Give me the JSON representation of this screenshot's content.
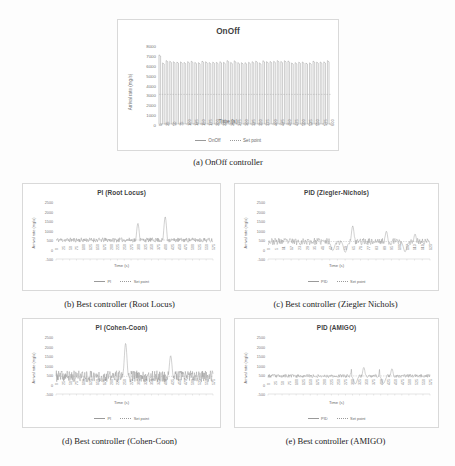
{
  "figure": {
    "caption_a": "(a) OnOff controller",
    "caption_b": "(b) Best controller (Root Locus)",
    "caption_c": "(c) Best controller (Ziegler Nichols)",
    "caption_d": "(d) Best controller (Cohen-Coon)",
    "caption_e": "(e) Best controller (AMIGO)"
  },
  "common": {
    "ylabel": "Arrival rate (mg/s)",
    "xlabel": "Time (s)",
    "setpoint_legend": "Set point",
    "line_color": "#8c8c8c",
    "setpoint_color": "#a6a6a6",
    "grid": false
  },
  "chart_data": [
    {
      "id": "a",
      "type": "line",
      "title": "OnOff",
      "xlabel": "Time (s)",
      "ylabel": "Arrival rate (mg/s)",
      "ylim": [
        0,
        8000
      ],
      "yticks": [
        8000,
        7000,
        6000,
        5000,
        4000,
        3000,
        2000,
        1000,
        0
      ],
      "xlim": [
        0,
        600
      ],
      "xticks": [
        0,
        25,
        50,
        75,
        100,
        125,
        150,
        175,
        200,
        225,
        250,
        275,
        300,
        325,
        350,
        375,
        400,
        425,
        450,
        475,
        500,
        525,
        550,
        575,
        600
      ],
      "legend": [
        "OnOff",
        "Set point"
      ],
      "legend_position": "bottom",
      "series": [
        {
          "name": "OnOff",
          "description": "Fast square-wave oscillation between ~0 and ~6300 mg/s, initial overshoot spike to ~7000 mg/s, ~48 full cycles over 600 s",
          "oscillation_low": 0,
          "oscillation_high": 6300,
          "first_peak": 7000,
          "cycles": 48
        },
        {
          "name": "Set point",
          "description": "Constant dashed reference line",
          "value": 3000
        }
      ]
    },
    {
      "id": "b",
      "type": "line",
      "title": "PI (Root Locus)",
      "xlabel": "Time (s)",
      "ylabel": "Arrival rate (mg/s)",
      "ylim": [
        -500,
        2500
      ],
      "yticks": [
        2500,
        2000,
        1500,
        1000,
        500,
        0,
        -500
      ],
      "xlim": [
        0,
        575
      ],
      "xticks": [
        0,
        25,
        50,
        75,
        100,
        125,
        150,
        175,
        200,
        225,
        250,
        275,
        300,
        325,
        350,
        375,
        400,
        425,
        450,
        475,
        500,
        525,
        550,
        575
      ],
      "legend": [
        "PI",
        "Set point"
      ],
      "legend_position": "bottom",
      "series": [
        {
          "name": "PI",
          "description": "Low-amplitude noise band around the set point with two large transient spikes",
          "baseline": 500,
          "noise_amplitude": 120,
          "spikes": [
            {
              "time": 300,
              "peak": 1300,
              "undershoot": 150
            },
            {
              "time": 400,
              "peak": 1650,
              "undershoot": 120
            }
          ]
        },
        {
          "name": "Set point",
          "value": 500
        }
      ]
    },
    {
      "id": "c",
      "type": "line",
      "title": "PID (Ziegler-Nichols)",
      "xlabel": "Time (s)",
      "ylabel": "Arrival rate (mg/s)",
      "ylim": [
        -500,
        2500
      ],
      "yticks": [
        2500,
        2000,
        1500,
        1000,
        500,
        0,
        -500
      ],
      "xlim": [
        0,
        130
      ],
      "xticks": [
        0,
        5,
        11,
        17,
        23,
        29,
        35,
        41,
        47,
        53,
        59,
        65,
        71,
        77,
        83,
        89,
        95,
        101,
        107,
        113,
        119,
        125
      ],
      "legend": [
        "PID",
        "Set point"
      ],
      "legend_position": "bottom",
      "series": [
        {
          "name": "PID",
          "description": "Noisy trace about the set point with several moderate spikes and dips",
          "baseline": 420,
          "noise_amplitude": 180,
          "spikes": [
            {
              "time": 68,
              "peak": 1180
            },
            {
              "time": 95,
              "peak": 900
            },
            {
              "time": 118,
              "peak": 750
            }
          ],
          "dips": [
            {
              "time": 52,
              "trough": -60
            },
            {
              "time": 62,
              "trough": -150
            },
            {
              "time": 110,
              "trough": -120
            }
          ]
        },
        {
          "name": "Set point",
          "value": 420
        }
      ]
    },
    {
      "id": "d",
      "type": "line",
      "title": "PI (Cohen-Coon)",
      "xlabel": "Time (s)",
      "ylabel": "Arrival rate (mg/s)",
      "ylim": [
        -500,
        2500
      ],
      "yticks": [
        2500,
        2000,
        1500,
        1000,
        500,
        0,
        -500
      ],
      "xlim": [
        0,
        575
      ],
      "xticks": [
        0,
        25,
        50,
        75,
        100,
        125,
        150,
        175,
        200,
        225,
        250,
        275,
        300,
        325,
        350,
        375,
        400,
        425,
        450,
        475,
        500,
        525,
        550,
        575
      ],
      "legend": [
        "PI",
        "Set point"
      ],
      "legend_position": "bottom",
      "series": [
        {
          "name": "PI",
          "description": "Dense high-frequency oscillation around the set point with one tall spike and one medium spike",
          "baseline": 430,
          "noise_amplitude": 300,
          "spikes": [
            {
              "time": 255,
              "peak": 2100
            },
            {
              "time": 420,
              "peak": 1450
            }
          ]
        },
        {
          "name": "Set point",
          "value": 430
        }
      ]
    },
    {
      "id": "e",
      "type": "line",
      "title": "PID (AMIGO)",
      "xlabel": "Time (s)",
      "ylabel": "Arrival rate (mg/s)",
      "ylim": [
        -500,
        2500
      ],
      "yticks": [
        2500,
        2000,
        1500,
        1000,
        500,
        0,
        -500
      ],
      "xlim": [
        0,
        575
      ],
      "xticks": [
        0,
        25,
        50,
        75,
        100,
        125,
        150,
        175,
        200,
        225,
        250,
        275,
        300,
        325,
        350,
        375,
        400,
        425,
        450,
        475,
        500,
        525,
        550,
        575
      ],
      "legend": [
        "PID",
        "Set point"
      ],
      "legend_position": "bottom",
      "series": [
        {
          "name": "PID",
          "description": "Tight low-amplitude noise around the set point with two clusters of moderate spikes",
          "baseline": 450,
          "noise_amplitude": 90,
          "spikes": [
            {
              "time": 300,
              "peak": 1000
            },
            {
              "time": 340,
              "peak": 830
            },
            {
              "time": 400,
              "peak": 1020
            },
            {
              "time": 440,
              "peak": 760
            }
          ],
          "dips": [
            {
              "time": 310,
              "trough": 30
            },
            {
              "time": 410,
              "trough": 60
            }
          ]
        },
        {
          "name": "Set point",
          "value": 450
        }
      ]
    }
  ]
}
